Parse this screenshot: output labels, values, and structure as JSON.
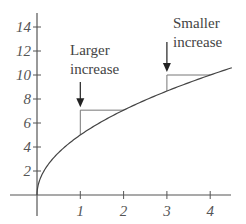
{
  "chart_data": {
    "type": "line",
    "title": "",
    "xlabel": "",
    "ylabel": "",
    "function": "y = 5*sqrt(x)",
    "x": [
      0,
      0.05,
      0.25,
      0.5,
      1,
      1.5,
      2,
      2.5,
      3,
      3.5,
      4,
      4.5
    ],
    "series": [
      {
        "name": "curve",
        "values": [
          0,
          1.12,
          2.5,
          3.54,
          5,
          6.12,
          7.07,
          7.91,
          8.66,
          9.35,
          10,
          10.61
        ]
      }
    ],
    "xlim": [
      0,
      4.6
    ],
    "ylim": [
      0,
      15
    ],
    "x_ticks": [
      "1",
      "2",
      "3",
      "4"
    ],
    "y_ticks": [
      "2",
      "4",
      "6",
      "8",
      "10",
      "12",
      "14"
    ],
    "grid": false,
    "legend": null,
    "annotations": [
      {
        "text_lines": [
          "Larger",
          "increase"
        ],
        "x_from": 1,
        "x_to": 2,
        "y_from": 5,
        "y_to": 7.07,
        "arrow_to_x": 1
      },
      {
        "text_lines": [
          "Smaller",
          "increase"
        ],
        "x_from": 3,
        "x_to": 4,
        "y_from": 8.66,
        "y_to": 10,
        "arrow_to_x": 3
      }
    ]
  },
  "colors": {
    "axis": "#555555",
    "curve": "#444444",
    "triangle": "#777777",
    "text": "#444444"
  }
}
